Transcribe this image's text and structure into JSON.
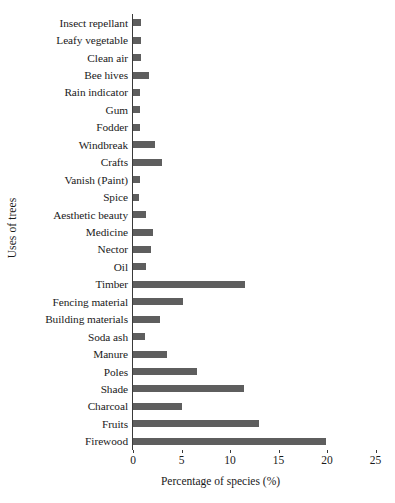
{
  "chart_data": {
    "type": "bar",
    "orientation": "horizontal",
    "title": "",
    "xlabel": "Percentage of species (%)",
    "ylabel": "Uses of trees",
    "xlim": [
      0,
      25
    ],
    "xticks": [
      0,
      5,
      10,
      15,
      20,
      25
    ],
    "xtick_labels": [
      "0",
      "5",
      "10",
      "15",
      "20",
      "25"
    ],
    "grid": false,
    "legend": false,
    "bar_color": "#5e5e5e",
    "axis_color": "#3a3a3a",
    "background_color": "#ffffff",
    "categories": [
      "Insect repellant",
      "Leafy vegetable",
      "Clean air",
      "Bee hives",
      "Rain indicator",
      "Gum",
      "Fodder",
      "Windbreak",
      "Crafts",
      "Vanish (Paint)",
      "Spice",
      "Aesthetic beauty",
      "Medicine",
      "Nector",
      "Oil",
      "Timber",
      "Fencing material",
      "Building materials",
      "Soda ash",
      "Manure",
      "Poles",
      "Shade",
      "Charcoal",
      "Fruits",
      "Firewood"
    ],
    "values": [
      0.8,
      0.8,
      0.8,
      1.7,
      0.7,
      0.7,
      0.7,
      2.3,
      3.0,
      0.7,
      0.6,
      1.3,
      2.1,
      1.9,
      1.3,
      11.5,
      5.2,
      2.8,
      1.2,
      3.5,
      6.6,
      11.4,
      5.0,
      13.0,
      19.9
    ]
  }
}
